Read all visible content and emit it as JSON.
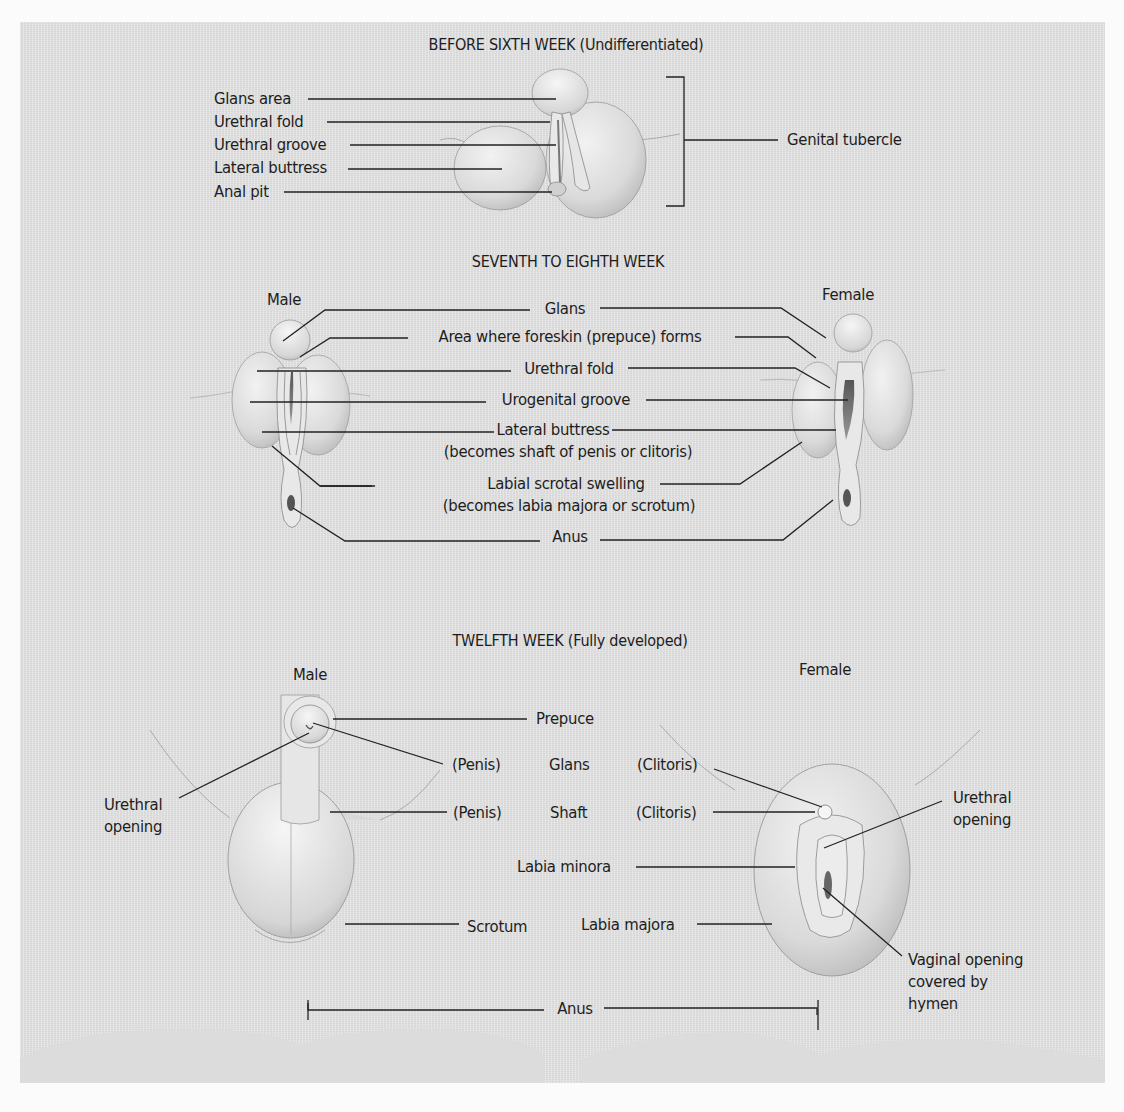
{
  "sections": {
    "undifferentiated": {
      "title": "BEFORE SIXTH WEEK (Undifferentiated)",
      "labels": {
        "glans_area": "Glans area",
        "urethral_fold": "Urethral fold",
        "urethral_groove": "Urethral groove",
        "lateral_buttress": "Lateral buttress",
        "anal_pit": "Anal pit",
        "genital_tubercle": "Genital tubercle"
      }
    },
    "seventh_eighth": {
      "title": "SEVENTH TO EIGHTH WEEK",
      "male": "Male",
      "female": "Female",
      "labels": {
        "glans": "Glans",
        "prepuce_area": "Area where foreskin (prepuce) forms",
        "urethral_fold": "Urethral fold",
        "urogenital_groove": "Urogenital groove",
        "lateral_buttress": "Lateral buttress",
        "lateral_buttress_note": "(becomes shaft of penis or clitoris)",
        "labial_scrotal": "Labial scrotal swelling",
        "labial_scrotal_note": "(becomes labia majora or scrotum)",
        "anus": "Anus"
      }
    },
    "twelfth": {
      "title": "TWELFTH WEEK (Fully developed)",
      "male": "Male",
      "female": "Female",
      "labels": {
        "prepuce": "Prepuce",
        "penis_glans": "(Penis)",
        "glans": "Glans",
        "clitoris_glans": "(Clitoris)",
        "penis_shaft": "(Penis)",
        "shaft": "Shaft",
        "clitoris_shaft": "(Clitoris)",
        "urethral_opening_male_1": "Urethral",
        "urethral_opening_male_2": "opening",
        "urethral_opening_female_1": "Urethral",
        "urethral_opening_female_2": "opening",
        "labia_minora": "Labia minora",
        "labia_majora": "Labia majora",
        "scrotum": "Scrotum",
        "vaginal_1": "Vaginal opening",
        "vaginal_2": "covered by",
        "vaginal_3": "hymen",
        "anus": "Anus"
      }
    }
  },
  "colors": {
    "panel": "#e3e3e3",
    "page": "#fbfbfb",
    "line": "#222222"
  }
}
